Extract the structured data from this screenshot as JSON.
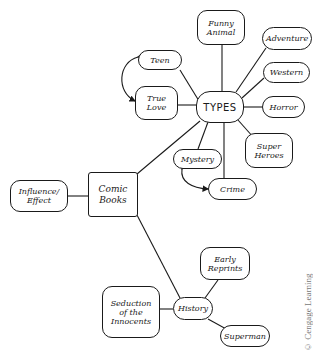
{
  "diagram": {
    "type": "mind-map",
    "central_node": "Comic Books",
    "nodes": {
      "comic_books": {
        "label": "Comic\nBooks"
      },
      "influence": {
        "label": "Influence/\nEffect"
      },
      "types": {
        "label": "TYPES"
      },
      "history": {
        "label": "History"
      },
      "teen": {
        "label": "Teen"
      },
      "true_love": {
        "label": "True\nLove"
      },
      "funny_animal": {
        "label": "Funny\nAnimal"
      },
      "adventure": {
        "label": "Adventure"
      },
      "western": {
        "label": "Western"
      },
      "horror": {
        "label": "Horror"
      },
      "super_heroes": {
        "label": "Super\nHeroes"
      },
      "mystery": {
        "label": "Mystery"
      },
      "crime": {
        "label": "Crime"
      },
      "early_reprints": {
        "label": "Early\nReprints"
      },
      "seduction": {
        "label": "Seduction\nof the\nInnocents"
      },
      "superman": {
        "label": "Superman"
      }
    },
    "edges": [
      [
        "comic_books",
        "influence"
      ],
      [
        "comic_books",
        "types"
      ],
      [
        "comic_books",
        "history"
      ],
      [
        "types",
        "teen"
      ],
      [
        "types",
        "true_love"
      ],
      [
        "types",
        "funny_animal"
      ],
      [
        "types",
        "adventure"
      ],
      [
        "types",
        "western"
      ],
      [
        "types",
        "horror"
      ],
      [
        "types",
        "super_heroes"
      ],
      [
        "types",
        "mystery"
      ],
      [
        "types",
        "crime"
      ],
      [
        "history",
        "early_reprints"
      ],
      [
        "history",
        "seduction"
      ],
      [
        "history",
        "superman"
      ]
    ],
    "bidirectional_arrows": [
      [
        "teen",
        "true_love"
      ],
      [
        "mystery",
        "crime"
      ]
    ]
  },
  "credit": "© Cengage Learning"
}
